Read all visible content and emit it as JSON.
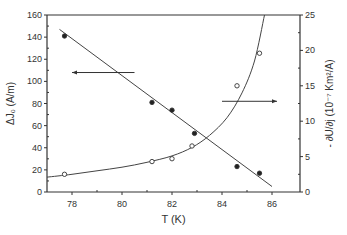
{
  "chart_data": {
    "type": "scatter",
    "title": "",
    "xlabel": "T (K)",
    "ylabel": "ΔJ₀ (A/m)",
    "y2label": "- ∂U/∂j (10⁻⁷ Km²/A)",
    "xlim": [
      77,
      86.2
    ],
    "ylim": [
      0,
      160
    ],
    "y2lim": [
      0,
      25
    ],
    "xticks": [
      78,
      80,
      82,
      84,
      86
    ],
    "yticks": [
      0,
      20,
      40,
      60,
      80,
      100,
      120,
      140,
      160
    ],
    "y2ticks": [
      0,
      5,
      10,
      15,
      20,
      25
    ],
    "grid": false,
    "legend": "none (arrows indicate axis)",
    "series": [
      {
        "name": "ΔJ₀",
        "axis": "left",
        "marker": "filled-circle",
        "x": [
          77.7,
          81.2,
          82.0,
          82.9,
          84.6,
          85.5
        ],
        "y": [
          141,
          81,
          74,
          53,
          23,
          17
        ],
        "fit": {
          "type": "linear",
          "x": [
            77.5,
            86.0
          ],
          "y": [
            147,
            5
          ]
        }
      },
      {
        "name": "-∂U/∂j",
        "axis": "right",
        "marker": "open-circle",
        "x": [
          77.7,
          81.2,
          82.0,
          82.8,
          84.6,
          85.5
        ],
        "y": [
          2.5,
          4.3,
          4.7,
          6.5,
          15.0,
          19.6
        ],
        "fit": {
          "type": "curve",
          "x": [
            77.0,
            78,
            79,
            80,
            81,
            82,
            82.8,
            83.5,
            84.2,
            84.8,
            85.3,
            85.7
          ],
          "y": [
            2.1,
            2.5,
            3.0,
            3.5,
            4.2,
            5.1,
            6.3,
            8.0,
            10.5,
            14.0,
            18.5,
            25
          ]
        }
      }
    ],
    "annotations": [
      {
        "type": "arrow",
        "direction": "left",
        "x": [
          78,
          80.5
        ],
        "y_left": 108,
        "meaning": "left axis series"
      },
      {
        "type": "arrow",
        "direction": "right",
        "x": [
          84,
          86.2
        ],
        "y_left": 82,
        "meaning": "right axis series"
      }
    ]
  }
}
